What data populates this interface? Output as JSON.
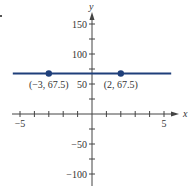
{
  "chart_data": {
    "type": "line",
    "title": "",
    "xlabel": "x",
    "ylabel": "y",
    "xlim": [
      -5.6,
      6
    ],
    "ylim": [
      -118,
      175
    ],
    "x_ticks": [
      -5,
      -4,
      -3,
      -2,
      -1,
      1,
      2,
      3,
      4,
      5
    ],
    "x_tick_labels": [
      {
        "value": -5,
        "label": "−5"
      },
      {
        "value": 5,
        "label": "5"
      }
    ],
    "y_ticks": [
      -100,
      -75,
      -50,
      -25,
      25,
      50,
      75,
      100,
      125,
      150
    ],
    "y_tick_labels": [
      {
        "value": 150,
        "label": "150"
      },
      {
        "value": 100,
        "label": "100"
      },
      {
        "value": 50,
        "label": "50"
      },
      {
        "value": -50,
        "label": "−50"
      },
      {
        "value": -100,
        "label": "−100"
      }
    ],
    "grid": false,
    "series": [
      {
        "name": "y = 67.5",
        "color": "#1f3f7a",
        "x": [
          -5.5,
          5.5
        ],
        "values": [
          67.5,
          67.5
        ]
      }
    ],
    "points": [
      {
        "x": -3,
        "y": 67.5,
        "label": "(−3, 67.5)"
      },
      {
        "x": 2,
        "y": 67.5,
        "label": "(2, 67.5)"
      }
    ],
    "colors": {
      "line": "#1f3f7a",
      "point": "#1f3f7a",
      "axis": "#444444",
      "text": "#333333"
    }
  }
}
